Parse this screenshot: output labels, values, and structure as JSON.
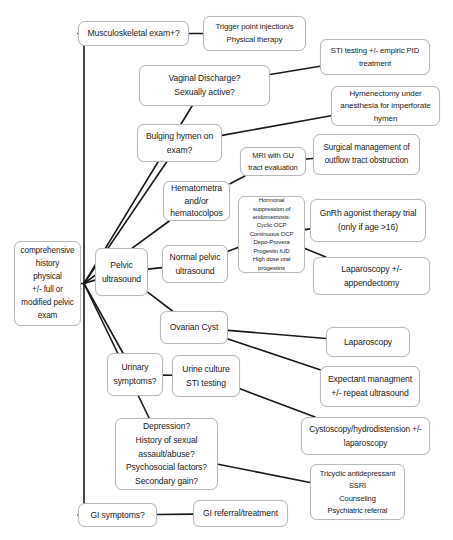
{
  "diagram": {
    "type": "flowchart",
    "background_color": "#ffffff",
    "node_border_color": "#b9b9b9",
    "edge_color": "#1a1a1a",
    "nodes": [
      {
        "id": "start",
        "lines": [
          "comprehensive",
          "history",
          "physical",
          "+/- full or",
          "modified pelvic",
          "exam"
        ],
        "x": 14,
        "y": 241,
        "w": 67,
        "h": 85
      },
      {
        "id": "musculoskeletal",
        "lines": [
          "Musculoskeletal exam+?"
        ],
        "x": 78,
        "y": 21,
        "w": 111,
        "h": 25
      },
      {
        "id": "trigger_point",
        "lines": [
          "Trigger point injection/s",
          "Physical therapy"
        ],
        "x": 203,
        "y": 16,
        "w": 103,
        "h": 35
      },
      {
        "id": "vaginal_discharge",
        "lines": [
          "Vaginal Discharge?",
          "Sexually active?"
        ],
        "x": 139,
        "y": 65,
        "w": 131,
        "h": 41
      },
      {
        "id": "sti_pid",
        "lines": [
          "STI testing +/- empiric PID",
          "treatment"
        ],
        "x": 320,
        "y": 39,
        "w": 110,
        "h": 36
      },
      {
        "id": "bulging_hymen",
        "lines": [
          "Bulging hymen on",
          "exam?"
        ],
        "x": 137,
        "y": 124,
        "w": 85,
        "h": 38
      },
      {
        "id": "hymenectomy",
        "lines": [
          "Hymenectomy under",
          "anesthesia for imperforate",
          "hymen"
        ],
        "x": 331,
        "y": 86,
        "w": 109,
        "h": 40
      },
      {
        "id": "mri_gu",
        "lines": [
          "MRI with GU",
          "tract evaluation"
        ],
        "x": 240,
        "y": 147,
        "w": 66,
        "h": 29
      },
      {
        "id": "surgical_outflow",
        "lines": [
          "Surgical management of",
          "outflow tract obstruction"
        ],
        "x": 313,
        "y": 134,
        "w": 107,
        "h": 41
      },
      {
        "id": "hematometra",
        "lines": [
          "Hematometra",
          "and/or",
          "hematocolpos"
        ],
        "x": 163,
        "y": 181,
        "w": 67,
        "h": 40
      },
      {
        "id": "hormonal",
        "lines": [
          "Hormonal",
          "suppression of",
          "endometriosis:",
          "Cyclic OCP",
          "Continuous OCP",
          "Depo-Provera",
          "Progestin IUD",
          "High dose oral",
          "progestins"
        ],
        "x": 238,
        "y": 196,
        "w": 67,
        "h": 77
      },
      {
        "id": "gnrh",
        "lines": [
          "GnRh agonist therapy trial",
          "(only if age >16)"
        ],
        "x": 310,
        "y": 199,
        "w": 116,
        "h": 43
      },
      {
        "id": "laparoscopy_appy",
        "lines": [
          "Laparoscopy +/-",
          "appendectomy"
        ],
        "x": 313,
        "y": 257,
        "w": 117,
        "h": 38
      },
      {
        "id": "pelvic_ultrasound",
        "lines": [
          "Pelvic",
          "ultrasound"
        ],
        "x": 95,
        "y": 248,
        "w": 53,
        "h": 48
      },
      {
        "id": "normal_pelvic_us",
        "lines": [
          "Normal pelvic",
          "ultrasound"
        ],
        "x": 162,
        "y": 245,
        "w": 66,
        "h": 38
      },
      {
        "id": "ovarian_cyst",
        "lines": [
          "Ovarian Cyst"
        ],
        "x": 160,
        "y": 311,
        "w": 68,
        "h": 33
      },
      {
        "id": "laparoscopy",
        "lines": [
          "Laparoscopy"
        ],
        "x": 326,
        "y": 327,
        "w": 84,
        "h": 30
      },
      {
        "id": "expectant",
        "lines": [
          "Expectant managment",
          "+/- repeat ultrasound"
        ],
        "x": 320,
        "y": 366,
        "w": 100,
        "h": 41
      },
      {
        "id": "urinary_symptoms",
        "lines": [
          "Urinary",
          "symptoms?"
        ],
        "x": 107,
        "y": 353,
        "w": 56,
        "h": 43
      },
      {
        "id": "urine_culture",
        "lines": [
          "Urine culture",
          "STI testing"
        ],
        "x": 172,
        "y": 355,
        "w": 68,
        "h": 42
      },
      {
        "id": "cystoscopy",
        "lines": [
          "Cystoscopy/hydrodistension +/-",
          "laparoscopy"
        ],
        "x": 301,
        "y": 417,
        "w": 129,
        "h": 38
      },
      {
        "id": "psychosocial",
        "lines": [
          "Depression?",
          "History of sexual",
          "assault/abuse?",
          "Psychosocial factors?",
          "Secondary gain?"
        ],
        "x": 115,
        "y": 418,
        "w": 103,
        "h": 72
      },
      {
        "id": "psych_treatment",
        "lines": [
          "Tricyclic antidepressant",
          "SSRI",
          "Counseling",
          "Psychiatric referral"
        ],
        "x": 310,
        "y": 464,
        "w": 95,
        "h": 56
      },
      {
        "id": "gi_symptoms",
        "lines": [
          "GI symptoms?"
        ],
        "x": 78,
        "y": 503,
        "w": 79,
        "h": 24
      },
      {
        "id": "gi_referral",
        "lines": [
          "GI referral/treatment"
        ],
        "x": 193,
        "y": 500,
        "w": 95,
        "h": 27
      }
    ],
    "edges": [
      {
        "from": "start",
        "to": "musculoskeletal"
      },
      {
        "from": "musculoskeletal",
        "to": "trigger_point"
      },
      {
        "from": "start",
        "to": "vaginal_discharge"
      },
      {
        "from": "vaginal_discharge",
        "to": "sti_pid"
      },
      {
        "from": "start",
        "to": "bulging_hymen"
      },
      {
        "from": "bulging_hymen",
        "to": "hymenectomy"
      },
      {
        "from": "mri_gu",
        "to": "surgical_outflow"
      },
      {
        "from": "start",
        "to": "hematometra"
      },
      {
        "from": "hematometra",
        "to": "mri_gu"
      },
      {
        "from": "start",
        "to": "pelvic_ultrasound"
      },
      {
        "from": "pelvic_ultrasound",
        "to": "normal_pelvic_us"
      },
      {
        "from": "normal_pelvic_us",
        "to": "hormonal"
      },
      {
        "from": "hormonal",
        "to": "gnrh"
      },
      {
        "from": "hormonal",
        "to": "laparoscopy_appy"
      },
      {
        "from": "pelvic_ultrasound",
        "to": "ovarian_cyst"
      },
      {
        "from": "ovarian_cyst",
        "to": "laparoscopy"
      },
      {
        "from": "ovarian_cyst",
        "to": "expectant"
      },
      {
        "from": "start",
        "to": "urinary_symptoms"
      },
      {
        "from": "urinary_symptoms",
        "to": "urine_culture"
      },
      {
        "from": "urine_culture",
        "to": "cystoscopy"
      },
      {
        "from": "start",
        "to": "psychosocial"
      },
      {
        "from": "psychosocial",
        "to": "psych_treatment"
      },
      {
        "from": "start",
        "to": "gi_symptoms"
      },
      {
        "from": "gi_symptoms",
        "to": "gi_referral"
      }
    ]
  }
}
